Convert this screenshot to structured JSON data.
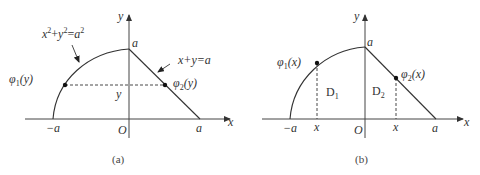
{
  "diagram_a": {
    "caption": "(a)",
    "axis_x_label": "x",
    "axis_y_label": "y",
    "origin_label": "O",
    "neg_a_label": "−a",
    "pos_a_label": "a",
    "top_a_label": "a",
    "y_label": "y",
    "circle_eq": {
      "x": "x",
      "sup1": "2",
      "plus": "+",
      "y": "y",
      "sup2": "2",
      "eq": "=",
      "a": "a",
      "sup3": "2"
    },
    "line_eq": "x+y=a",
    "phi1": {
      "phi": "φ",
      "sub": "1",
      "arg": "(y)"
    },
    "phi2": {
      "phi": "φ",
      "sub": "2",
      "arg": "(y)"
    }
  },
  "diagram_b": {
    "caption": "(b)",
    "axis_x_label": "x",
    "axis_y_label": "y",
    "origin_label": "O",
    "neg_a_label": "−a",
    "pos_a_label": "a",
    "top_a_label": "a",
    "x1_label": "x",
    "x2_label": "x",
    "region1": {
      "D": "D",
      "sub": "1"
    },
    "region2": {
      "D": "D",
      "sub": "2"
    },
    "phi1": {
      "phi": "φ",
      "sub": "1",
      "arg": "(x)"
    },
    "phi2": {
      "phi": "φ",
      "sub": "2",
      "arg": "(x)"
    }
  }
}
